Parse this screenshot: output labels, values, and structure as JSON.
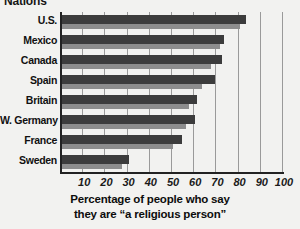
{
  "title": "Nations",
  "axis_caption_line1": "Percentage of people who  say",
  "axis_caption_line2": "they are “a religious person”",
  "colors": {
    "bar_main": "#3c3c3c",
    "bar_shadow": "#8d8d8d",
    "axis": "#222222",
    "gridline": "#9a9a9a",
    "background": "#f2f2f0"
  },
  "chart_data": {
    "type": "bar",
    "orientation": "horizontal",
    "title": "Nations",
    "xlabel": "Percentage of people who  say they are “a religious person”",
    "ylabel": "",
    "xlim": [
      0,
      100
    ],
    "ylim": null,
    "grid": true,
    "legend": null,
    "xticks": [
      10,
      20,
      30,
      40,
      50,
      60,
      70,
      80,
      90,
      100
    ],
    "xtick_labels": [
      "10",
      "20",
      "30",
      "40",
      "50",
      "60",
      "70",
      "80",
      "90",
      "100"
    ],
    "categories": [
      "U.S.",
      "Mexico",
      "Canada",
      "Spain",
      "Britain",
      "W. Germany",
      "France",
      "Sweden"
    ],
    "values": [
      83,
      73,
      72,
      69,
      61,
      60,
      54,
      30
    ],
    "shadow_values": [
      80,
      71,
      67,
      63,
      57,
      56,
      50,
      27
    ]
  }
}
